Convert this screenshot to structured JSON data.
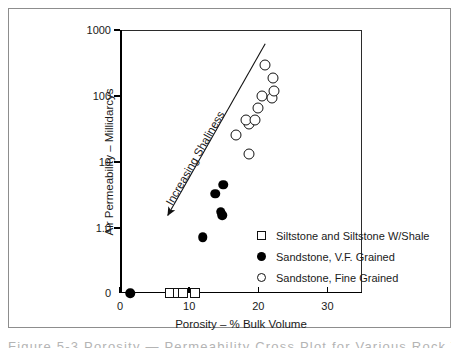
{
  "figure": {
    "top_sliver_text": "",
    "caption_clipped": "Figure  5-3 Porosity — Permeability Cross Plot for Various Rock Types, North"
  },
  "chart_data": {
    "type": "scatter",
    "title": "",
    "xlabel": "Porosity – % Bulk Volume",
    "ylabel": "Air Permeability – Millidarcys",
    "xlim": [
      0,
      35
    ],
    "xticks": [
      0,
      10,
      20,
      30
    ],
    "xticklabels": [
      "0",
      "10",
      "20",
      "30"
    ],
    "yscale": "log-with-zero-break",
    "ylim": [
      1.0,
      1000
    ],
    "yticks": [
      1000,
      100,
      10,
      1.0
    ],
    "yticklabels": [
      "1000",
      "100",
      "10",
      "1.0"
    ],
    "zero_label": "0",
    "grid": false,
    "legend_position": "lower-right-inside",
    "annotations": [
      {
        "text": "Increasing Shaliness",
        "kind": "arrow-label",
        "direction": "down-left",
        "arrow_from": [
          21.0,
          620
        ],
        "arrow_to": [
          6.9,
          1.55
        ]
      }
    ],
    "series": [
      {
        "name": "Siltstone and Siltstone W/Shale",
        "marker": "open-square",
        "points": [
          {
            "x": 7.3,
            "y": 0
          },
          {
            "x": 8.4,
            "y": 0
          },
          {
            "x": 9.1,
            "y": 0
          },
          {
            "x": 10.8,
            "y": 0
          }
        ]
      },
      {
        "name": "Sandstone, V.F. Grained",
        "marker": "filled-circle",
        "points": [
          {
            "x": 1.5,
            "y": 0
          },
          {
            "x": 12.0,
            "y": 0.72
          },
          {
            "x": 13.8,
            "y": 3.3
          },
          {
            "x": 14.9,
            "y": 4.5
          },
          {
            "x": 14.6,
            "y": 1.75
          },
          {
            "x": 14.8,
            "y": 1.55
          }
        ]
      },
      {
        "name": "Sandstone, Fine Grained",
        "marker": "open-circle",
        "points": [
          {
            "x": 18.6,
            "y": 13.0
          },
          {
            "x": 16.8,
            "y": 26.0
          },
          {
            "x": 18.6,
            "y": 37.0
          },
          {
            "x": 18.2,
            "y": 44.0
          },
          {
            "x": 19.5,
            "y": 44.0
          },
          {
            "x": 19.9,
            "y": 66.0
          },
          {
            "x": 20.6,
            "y": 100.0
          },
          {
            "x": 22.0,
            "y": 92.0
          },
          {
            "x": 22.3,
            "y": 120.0
          },
          {
            "x": 22.2,
            "y": 190.0
          },
          {
            "x": 21.0,
            "y": 300.0
          }
        ]
      }
    ]
  },
  "legend": {
    "items": [
      {
        "label": "Siltstone and Siltstone W/Shale",
        "marker": "open-square"
      },
      {
        "label": "Sandstone, V.F. Grained",
        "marker": "filled-circle"
      },
      {
        "label": "Sandstone, Fine Grained",
        "marker": "open-circle"
      }
    ]
  }
}
